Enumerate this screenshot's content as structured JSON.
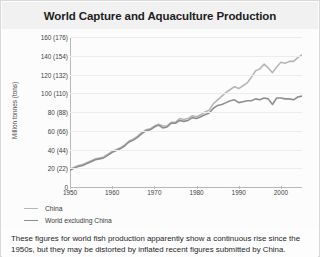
{
  "title": "World Capture and Aquaculture Production",
  "caption": "These figures for world fish production apparently show a continuous rise since the 1950s, but they may be distorted by inflated recent figures submitted by China.",
  "colors": {
    "series_china": "#b6b6b6",
    "series_world_excluding_china": "#8e8e8e",
    "gridline": "#ececec",
    "axis": "#b9b9b9",
    "title_bg": "#f1f1f1",
    "text": "#1d1d1d"
  },
  "chart_data": {
    "type": "line",
    "title": "World Capture and Aquaculture Production",
    "xlabel": "",
    "ylabel": "Million tonnes (tons)",
    "xlim": [
      1950,
      2005
    ],
    "ylim": [
      0,
      160
    ],
    "grid": true,
    "legend_position": "below-left",
    "ytick_values": [
      0,
      20,
      40,
      60,
      80,
      100,
      120,
      140,
      160
    ],
    "ytick_labels": [
      "0",
      "20 (22)",
      "40 (44)",
      "60 (66)",
      "80 (88)",
      "100 (110)",
      "120 (132)",
      "140 (154)",
      "160 (176)"
    ],
    "xtick_values": [
      1950,
      1960,
      1970,
      1980,
      1990,
      2000
    ],
    "xtick_labels": [
      "1950",
      "1960",
      "1970",
      "1980",
      "1990",
      "2000"
    ],
    "x": [
      1950,
      1951,
      1952,
      1953,
      1954,
      1955,
      1956,
      1957,
      1958,
      1959,
      1960,
      1961,
      1962,
      1963,
      1964,
      1965,
      1966,
      1967,
      1968,
      1969,
      1970,
      1971,
      1972,
      1973,
      1974,
      1975,
      1976,
      1977,
      1978,
      1979,
      1980,
      1981,
      1982,
      1983,
      1984,
      1985,
      1986,
      1987,
      1988,
      1989,
      1990,
      1991,
      1992,
      1993,
      1994,
      1995,
      1996,
      1997,
      1998,
      1999,
      2000,
      2001,
      2002,
      2003,
      2004,
      2005
    ],
    "series": [
      {
        "name": "China",
        "color": "#b6b6b6",
        "values": [
          19,
          21,
          23,
          24,
          26,
          28,
          30,
          31,
          32,
          35,
          38,
          40,
          42,
          45,
          49,
          51,
          54,
          58,
          61,
          62,
          65,
          67,
          65,
          65,
          69,
          69,
          73,
          72,
          73,
          76,
          75,
          77,
          80,
          82,
          89,
          93,
          97,
          101,
          104,
          107,
          105,
          108,
          111,
          117,
          124,
          126,
          131,
          127,
          122,
          128,
          133,
          132,
          134,
          134,
          138,
          141
        ]
      },
      {
        "name": "World excluding China",
        "color": "#8e8e8e",
        "values": [
          18,
          20,
          22,
          23,
          25,
          27,
          29,
          30,
          31,
          34,
          37,
          39,
          41,
          44,
          48,
          50,
          53,
          57,
          60,
          61,
          64,
          66,
          63,
          64,
          68,
          68,
          71,
          70,
          71,
          74,
          73,
          75,
          77,
          79,
          84,
          87,
          88,
          90,
          92,
          93,
          90,
          91,
          92,
          92,
          94,
          93,
          95,
          94,
          88,
          95,
          95,
          94,
          94,
          93,
          96,
          97
        ]
      }
    ]
  },
  "legend": [
    {
      "label": "China",
      "color": "#b6b6b6"
    },
    {
      "label": "World excluding China",
      "color": "#8e8e8e"
    }
  ]
}
